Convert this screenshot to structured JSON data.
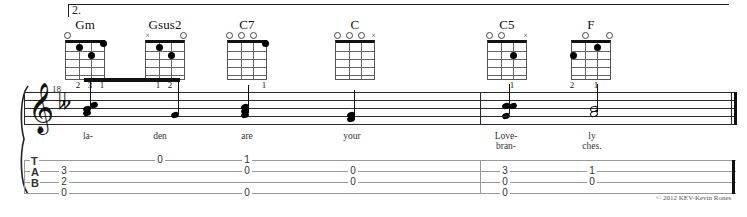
{
  "score": {
    "volta_label": "2.",
    "measure_number": "18",
    "clef": "treble-8",
    "key_signature": "one-flat",
    "copyright": "© 2012 KEV-Kevin Rones"
  },
  "chords": [
    {
      "name": "Gm",
      "x": 62,
      "strings": 4,
      "markers": [
        "o",
        "",
        "",
        ""
      ],
      "dots": [
        {
          "string": 2,
          "fret": 1
        },
        {
          "string": 3,
          "fret": 2
        },
        {
          "string": 4,
          "fret": 0.5
        }
      ],
      "fingers": [
        "",
        "2",
        "3",
        "1"
      ]
    },
    {
      "name": "Gsus2",
      "x": 142,
      "strings": 4,
      "markers": [
        "x",
        "",
        "",
        "o"
      ],
      "dots": [
        {
          "string": 2,
          "fret": 1
        },
        {
          "string": 3,
          "fret": 2
        }
      ],
      "fingers": [
        "",
        "1",
        "2",
        ""
      ]
    },
    {
      "name": "C7",
      "x": 224,
      "strings": 4,
      "markers": [
        "o",
        "o",
        "o",
        ""
      ],
      "dots": [
        {
          "string": 4,
          "fret": 0.5
        }
      ],
      "fingers": [
        "",
        "",
        "",
        "1"
      ]
    },
    {
      "name": "C",
      "x": 332,
      "strings": 4,
      "markers": [
        "o",
        "o",
        "o",
        "x"
      ],
      "dots": [],
      "fingers": [
        "",
        "",
        "",
        ""
      ]
    },
    {
      "name": "C5",
      "x": 484,
      "strings": 4,
      "markers": [
        "o",
        "o",
        "",
        "x"
      ],
      "dots": [
        {
          "string": 3,
          "fret": 2
        }
      ],
      "fingers": [
        "",
        "",
        "1",
        ""
      ]
    },
    {
      "name": "F",
      "x": 568,
      "strings": 4,
      "markers": [
        "",
        "o",
        "",
        "o"
      ],
      "dots": [
        {
          "string": 1,
          "fret": 2
        },
        {
          "string": 3,
          "fret": 1
        }
      ],
      "fingers": [
        "2",
        "",
        "1",
        ""
      ]
    }
  ],
  "lyrics": [
    {
      "text": "la-",
      "x": 88,
      "line": 1
    },
    {
      "text": "den",
      "x": 160,
      "line": 1
    },
    {
      "text": "are",
      "x": 247,
      "line": 1
    },
    {
      "text": "your",
      "x": 352,
      "line": 1
    },
    {
      "text": "Love-",
      "x": 506,
      "line": 1
    },
    {
      "text": "bran-",
      "x": 506,
      "line": 2
    },
    {
      "text": "ly",
      "x": 592,
      "line": 1
    },
    {
      "text": "ches.",
      "x": 592,
      "line": 2
    }
  ],
  "tab": {
    "letters": [
      "T",
      "A",
      "B"
    ],
    "notes": [
      {
        "x": 64,
        "string": 2,
        "fret": "3"
      },
      {
        "x": 64,
        "string": 3,
        "fret": "2"
      },
      {
        "x": 64,
        "string": 4,
        "fret": "0"
      },
      {
        "x": 160,
        "string": 1,
        "fret": "0"
      },
      {
        "x": 247,
        "string": 1,
        "fret": "1"
      },
      {
        "x": 247,
        "string": 2,
        "fret": "0"
      },
      {
        "x": 247,
        "string": 4,
        "fret": "0"
      },
      {
        "x": 353,
        "string": 2,
        "fret": "0"
      },
      {
        "x": 353,
        "string": 3,
        "fret": "0"
      },
      {
        "x": 505,
        "string": 2,
        "fret": "3"
      },
      {
        "x": 505,
        "string": 3,
        "fret": "0"
      },
      {
        "x": 505,
        "string": 4,
        "fret": "0"
      },
      {
        "x": 592,
        "string": 2,
        "fret": "1"
      },
      {
        "x": 592,
        "string": 3,
        "fret": "0"
      }
    ]
  },
  "chart_data": {
    "type": "table",
    "measures": [
      {
        "number": "18",
        "chords": [
          "Gm",
          "Gsus2",
          "C7",
          "C"
        ],
        "lyrics": [
          "la-",
          "den",
          "are",
          "your"
        ]
      },
      {
        "number": "19",
        "chords": [
          "C5",
          "F"
        ],
        "lyrics": [
          "Love-/bran-",
          "ly/ches."
        ]
      }
    ]
  }
}
